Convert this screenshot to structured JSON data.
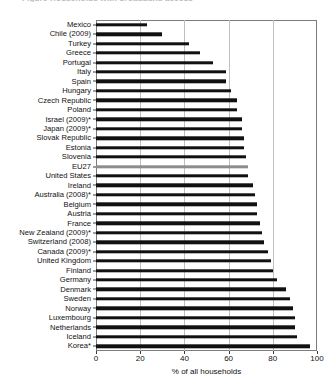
{
  "figure": {
    "caption_fragment": "Figure  Households with broadband access",
    "bar_color": "#111111",
    "highlight_color": "#8d8d8d"
  },
  "chart_data": {
    "type": "bar",
    "orientation": "horizontal",
    "title": "",
    "xlabel": "% of all households",
    "ylabel": "",
    "xlim": [
      0,
      100
    ],
    "xticks": [
      0,
      20,
      40,
      60,
      80,
      100
    ],
    "grid": true,
    "legend": false,
    "highlight_category": "EU27",
    "categories": [
      "Mexico",
      "Chile (2009)",
      "Turkey",
      "Greece",
      "Portugal",
      "Italy",
      "Spain",
      "Hungary",
      "Czech Republic",
      "Poland",
      "Israel (2009)*",
      "Japan (2009)*",
      "Slovak Republic",
      "Estonia",
      "Slovenia",
      "EU27",
      "United States",
      "Ireland",
      "Australia (2008)*",
      "Belgium",
      "Austria",
      "France",
      "New Zealand (2009)*",
      "Switzerland (2008)",
      "Canada (2009)*",
      "United Kingdom",
      "Finland",
      "Germany",
      "Denmark",
      "Sweden",
      "Norway",
      "Luxembourg",
      "Netherlands",
      "Iceland",
      "Korea*"
    ],
    "values": [
      23,
      30,
      42,
      47,
      53,
      59,
      59,
      61,
      64,
      64,
      66,
      66,
      67,
      67,
      68,
      69,
      69,
      71,
      72,
      73,
      73,
      74,
      75,
      76,
      78,
      79,
      80,
      82,
      86,
      88,
      89,
      90,
      90,
      91,
      97
    ]
  }
}
